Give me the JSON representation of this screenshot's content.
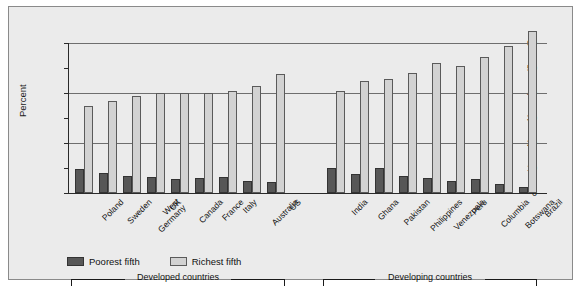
{
  "chart_data": {
    "type": "bar",
    "title": "",
    "subtitle": "",
    "xlabel": "",
    "ylabel": "Percent",
    "ylim": [
      0,
      60
    ],
    "yticks": [
      0,
      10,
      20,
      30,
      40,
      50,
      60
    ],
    "gridlines_at": [
      20,
      40,
      60
    ],
    "grid": true,
    "legend_position": "bottom-left",
    "categories": [
      "Poland",
      "Sweden",
      "West Germany",
      "UK",
      "Canada",
      "France",
      "Italy",
      "Australia",
      "US",
      "India",
      "Ghana",
      "Pakistan",
      "Philippines",
      "Venezuela",
      "Peru",
      "Columbia",
      "Botswana",
      "Brazil"
    ],
    "series": [
      {
        "name": "Poorest fifth",
        "color": "#575757",
        "values": [
          9.5,
          8.0,
          7.0,
          6.5,
          5.5,
          6.0,
          6.5,
          5.0,
          4.5,
          10.0,
          7.5,
          10.0,
          7.0,
          6.0,
          5.0,
          5.5,
          3.5,
          2.5
        ]
      },
      {
        "name": "Richest fifth",
        "color": "#d2d2d2",
        "values": [
          35.0,
          37.0,
          39.0,
          40.0,
          40.0,
          40.0,
          41.0,
          43.0,
          47.5,
          41.0,
          45.0,
          45.5,
          48.0,
          52.0,
          51.0,
          54.5,
          59.0,
          65.0
        ]
      }
    ],
    "groups": [
      {
        "label": "Developed countries",
        "categories": [
          "Poland",
          "Sweden",
          "West Germany",
          "UK",
          "Canada",
          "France",
          "Italy",
          "Australia",
          "US"
        ]
      },
      {
        "label": "Developing countries",
        "categories": [
          "India",
          "Ghana",
          "Pakistan",
          "Philippines",
          "Venezuela",
          "Peru",
          "Columbia",
          "Botswana",
          "Brazil"
        ]
      }
    ]
  },
  "axis": {
    "y_title": "Percent",
    "y_tick_labels": [
      "60",
      "50",
      "40",
      "30",
      "20",
      "10",
      "0"
    ]
  },
  "legend": {
    "items": [
      {
        "label": "Poorest fifth",
        "swatch": "poor"
      },
      {
        "label": "Richest fifth",
        "swatch": "rich"
      }
    ]
  },
  "group_braces": [
    {
      "label": "Developed countries"
    },
    {
      "label": "Developing countries"
    }
  ]
}
